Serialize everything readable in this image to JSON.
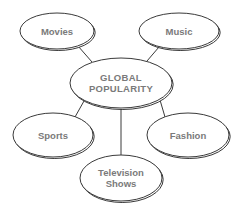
{
  "diagram": {
    "type": "mind-map",
    "center": {
      "id": "global",
      "lines": [
        "GLOBAL",
        "POPULARITY"
      ],
      "cx": 121,
      "cy": 83,
      "rx": 51,
      "ry": 25
    },
    "nodes": [
      {
        "id": "movies",
        "lines": [
          "Movies"
        ],
        "cx": 57,
        "cy": 31,
        "rx": 37,
        "ry": 18
      },
      {
        "id": "music",
        "lines": [
          "Music"
        ],
        "cx": 179,
        "cy": 31,
        "rx": 40,
        "ry": 18
      },
      {
        "id": "sports",
        "lines": [
          "Sports"
        ],
        "cx": 53,
        "cy": 135,
        "rx": 40,
        "ry": 22
      },
      {
        "id": "fashion",
        "lines": [
          "Fashion"
        ],
        "cx": 188,
        "cy": 135,
        "rx": 41,
        "ry": 22
      },
      {
        "id": "television",
        "lines": [
          "Television",
          "Shows"
        ],
        "cx": 121,
        "cy": 178,
        "rx": 41,
        "ry": 23
      }
    ],
    "edges": [
      {
        "from": "global",
        "to": "movies",
        "x1": 92,
        "y1": 62,
        "x2": 78,
        "y2": 46
      },
      {
        "from": "global",
        "to": "music",
        "x1": 147,
        "y1": 61,
        "x2": 159,
        "y2": 47
      },
      {
        "from": "global",
        "to": "sports",
        "x1": 84,
        "y1": 101,
        "x2": 75,
        "y2": 117
      },
      {
        "from": "global",
        "to": "fashion",
        "x1": 160,
        "y1": 100,
        "x2": 165,
        "y2": 117
      },
      {
        "from": "global",
        "to": "television",
        "x1": 121,
        "y1": 108,
        "x2": 121,
        "y2": 155
      }
    ],
    "colors": {
      "stroke": "#3a3a3a",
      "text": "#7a7a7a",
      "fill": "#ffffff",
      "shadow": "#d8d8d8"
    }
  }
}
